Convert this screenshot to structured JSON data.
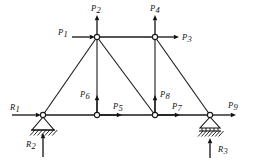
{
  "figure": {
    "background_color": "#ffffff",
    "line_color": "#111111"
  },
  "geometry": {
    "joints": [
      {
        "id": "A",
        "name": "bottom-left-support-joint",
        "x": 43,
        "y": 115
      },
      {
        "id": "B",
        "name": "bottom-second-joint",
        "x": 97,
        "y": 115
      },
      {
        "id": "C",
        "name": "bottom-third-joint",
        "x": 155,
        "y": 115
      },
      {
        "id": "D",
        "name": "bottom-right-support-joint",
        "x": 210,
        "y": 115
      },
      {
        "id": "E",
        "name": "top-left-joint",
        "x": 97,
        "y": 37
      },
      {
        "id": "F",
        "name": "top-right-joint",
        "x": 155,
        "y": 37
      }
    ],
    "members": [
      {
        "name": "bottom-chord-A-B",
        "from": "A",
        "to": "B"
      },
      {
        "name": "bottom-chord-B-C",
        "from": "B",
        "to": "C"
      },
      {
        "name": "bottom-chord-C-D",
        "from": "C",
        "to": "D"
      },
      {
        "name": "top-chord-E-F",
        "from": "E",
        "to": "F"
      },
      {
        "name": "left-diagonal-A-E",
        "from": "A",
        "to": "E"
      },
      {
        "name": "vertical-B-E",
        "from": "B",
        "to": "E"
      },
      {
        "name": "diagonal-C-E",
        "from": "C",
        "to": "E"
      },
      {
        "name": "vertical-C-F",
        "from": "C",
        "to": "F"
      },
      {
        "name": "right-diagonal-D-F",
        "from": "D",
        "to": "F"
      }
    ]
  },
  "loads": [
    {
      "key": "P1",
      "letter": "P",
      "sub": "1",
      "name": "load-p1",
      "direction": "right",
      "applied_at": "E",
      "label_x": 58,
      "label_y": 35,
      "tail_x": 72,
      "tail_y": 37,
      "tip_x": 95,
      "tip_y": 37
    },
    {
      "key": "P2",
      "letter": "P",
      "sub": "2",
      "name": "load-p2",
      "direction": "up",
      "applied_at": "E",
      "label_x": 91,
      "label_y": 11,
      "tail_x": 97,
      "tail_y": 35,
      "tip_x": 97,
      "tip_y": 15
    },
    {
      "key": "P3",
      "letter": "P",
      "sub": "3",
      "name": "load-p3",
      "direction": "right",
      "applied_at": "F",
      "label_x": 182,
      "label_y": 40,
      "tail_x": 157,
      "tail_y": 37,
      "tip_x": 179,
      "tip_y": 37
    },
    {
      "key": "P4",
      "letter": "P",
      "sub": "4",
      "name": "load-p4",
      "direction": "up",
      "applied_at": "F",
      "label_x": 150,
      "label_y": 11,
      "tail_x": 155,
      "tail_y": 35,
      "tip_x": 155,
      "tip_y": 15
    },
    {
      "key": "P5",
      "letter": "P",
      "sub": "5",
      "name": "load-p5",
      "direction": "right",
      "applied_at": "B",
      "label_x": 113,
      "label_y": 109,
      "tail_x": 99,
      "tail_y": 115,
      "tip_x": 122,
      "tip_y": 115
    },
    {
      "key": "P6",
      "letter": "P",
      "sub": "6",
      "name": "load-p6",
      "direction": "up",
      "applied_at": "B",
      "label_x": 80,
      "label_y": 97,
      "tail_x": 97,
      "tail_y": 113,
      "tip_x": 97,
      "tip_y": 95
    },
    {
      "key": "P7",
      "letter": "P",
      "sub": "7",
      "name": "load-p7",
      "direction": "right",
      "applied_at": "C",
      "label_x": 172,
      "label_y": 109,
      "tail_x": 157,
      "tail_y": 115,
      "tip_x": 180,
      "tip_y": 115
    },
    {
      "key": "P8",
      "letter": "P",
      "sub": "8",
      "name": "load-p8",
      "direction": "up",
      "applied_at": "C",
      "label_x": 160,
      "label_y": 97,
      "tail_x": 155,
      "tail_y": 113,
      "tip_x": 155,
      "tip_y": 95
    },
    {
      "key": "P9",
      "letter": "P",
      "sub": "9",
      "name": "load-p9",
      "direction": "right",
      "applied_at": "D",
      "label_x": 228,
      "label_y": 108,
      "tail_x": 212,
      "tail_y": 115,
      "tip_x": 236,
      "tip_y": 115
    }
  ],
  "reactions": [
    {
      "key": "R1",
      "letter": "R",
      "sub": "1",
      "name": "reaction-r1",
      "direction": "right",
      "applied_at": "A",
      "label_x": 10,
      "label_y": 110,
      "tail_x": 12,
      "tail_y": 115,
      "tip_x": 41,
      "tip_y": 115
    },
    {
      "key": "R2",
      "letter": "R",
      "sub": "2",
      "name": "reaction-r2",
      "direction": "up",
      "applied_at": "A",
      "label_x": 26,
      "label_y": 147,
      "tail_x": 43,
      "tail_y": 157,
      "tip_x": 43,
      "tip_y": 133
    },
    {
      "key": "R3",
      "letter": "R",
      "sub": "3",
      "name": "reaction-r3",
      "direction": "up",
      "applied_at": "D",
      "label_x": 218,
      "label_y": 152,
      "tail_x": 210,
      "tail_y": 158,
      "tip_x": 210,
      "tip_y": 138
    }
  ],
  "supports": [
    {
      "name": "pin-support-left",
      "type": "pinned",
      "at": "A",
      "apex_x": 43,
      "apex_y": 117,
      "base_y": 130,
      "half_width": 11
    },
    {
      "name": "roller-support-right",
      "type": "roller",
      "at": "D",
      "apex_x": 210,
      "apex_y": 117,
      "base_y": 128,
      "half_width": 10
    }
  ]
}
